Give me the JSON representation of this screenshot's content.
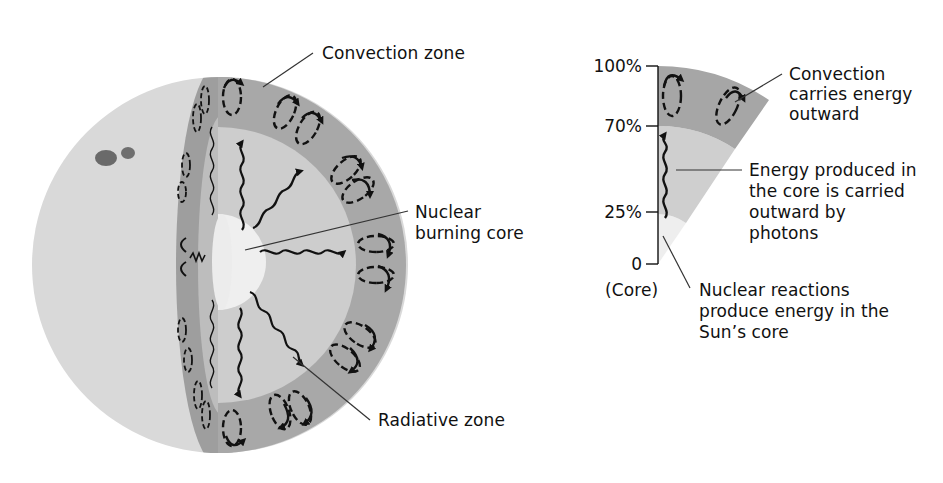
{
  "figure": {
    "colors": {
      "surface": "#d9d9d9",
      "convection_zone": "#a9a9a9",
      "convection_cut_face": "#9a9a9a",
      "radiative_zone": "#cfcfcf",
      "core": "#eeeeee",
      "sunspot": "#666666",
      "arrows": "#111111",
      "leader_lines": "#333333"
    }
  },
  "main_diagram": {
    "labels": {
      "convection_zone": "Convection zone",
      "core_line1": "Nuclear",
      "core_line2": "burning core",
      "radiative_zone": "Radiative zone"
    }
  },
  "profile_diagram": {
    "axis_ticks": [
      {
        "label": "100%",
        "fraction": 1.0
      },
      {
        "label": "70%",
        "fraction": 0.7
      },
      {
        "label": "25%",
        "fraction": 0.25
      },
      {
        "label": "0",
        "fraction": 0.0
      }
    ],
    "axis_note": "(Core)",
    "annotations": {
      "convection": [
        "Convection",
        "carries energy",
        "outward"
      ],
      "radiation": [
        "Energy produced in",
        "the core is carried",
        "outward by",
        "photons"
      ],
      "core": [
        "Nuclear reactions",
        "produce energy in the",
        "Sun’s core"
      ]
    }
  }
}
